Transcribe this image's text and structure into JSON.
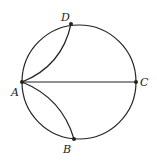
{
  "diagram": {
    "type": "geometry-circle",
    "circle": {
      "cx": 79,
      "cy": 82,
      "r": 57
    },
    "points": {
      "A": {
        "label": "A",
        "x": 22,
        "y": 82
      },
      "B": {
        "label": "B",
        "x": 74,
        "y": 139
      },
      "C": {
        "label": "C",
        "x": 136,
        "y": 82
      },
      "D": {
        "label": "D",
        "x": 71,
        "y": 24
      }
    },
    "segments": [
      {
        "from": "A",
        "to": "C",
        "kind": "diameter"
      }
    ],
    "arcs": [
      {
        "from": "A",
        "to": "D",
        "kind": "inner-arc"
      },
      {
        "from": "A",
        "to": "B",
        "kind": "inner-arc"
      }
    ],
    "stroke_color": "#222222"
  }
}
